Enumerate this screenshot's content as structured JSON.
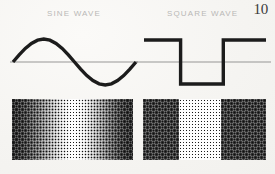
{
  "page": {
    "number": "10",
    "width": 275,
    "height": 174,
    "background_color": "#f7f6f3",
    "ink_color": "#1c1c1c",
    "caption_color": "#b9b8b6",
    "axis_color": "#6f6f6f"
  },
  "figures": [
    {
      "id": "sine",
      "caption": "SINE WAVE",
      "wave_type": "sine",
      "description": "One full cycle of a sine wave drawn with a heavy black stroke over a thin horizontal zero axis."
    },
    {
      "id": "square",
      "caption": "SQUARE WAVE",
      "wave_type": "square",
      "description": "One full cycle of a square wave drawn with a heavy black stroke over a thin horizontal zero axis."
    }
  ],
  "chart_data": [
    {
      "type": "line",
      "id": "sine-wave-plot",
      "title": "SINE WAVE",
      "xlabel": "",
      "ylabel": "",
      "xlim": [
        0,
        1
      ],
      "ylim": [
        -1,
        1
      ],
      "grid": false,
      "legend": "none",
      "axis": {
        "zero_line": 0,
        "zero_line_visible": true
      },
      "series": [
        {
          "name": "sine",
          "x": [
            0.0,
            0.05,
            0.1,
            0.15,
            0.2,
            0.25,
            0.3,
            0.35,
            0.4,
            0.45,
            0.5,
            0.55,
            0.6,
            0.65,
            0.7,
            0.75,
            0.8,
            0.85,
            0.9,
            0.95,
            1.0
          ],
          "y": [
            0.0,
            0.31,
            0.59,
            0.81,
            0.95,
            1.0,
            0.95,
            0.81,
            0.59,
            0.31,
            0.0,
            -0.31,
            -0.59,
            -0.81,
            -0.95,
            -1.0,
            -0.95,
            -0.81,
            -0.59,
            -0.31,
            0.0
          ]
        }
      ]
    },
    {
      "type": "line",
      "id": "square-wave-plot",
      "title": "SQUARE WAVE",
      "xlabel": "",
      "ylabel": "",
      "xlim": [
        0,
        1
      ],
      "ylim": [
        -1,
        1
      ],
      "grid": false,
      "legend": "none",
      "axis": {
        "zero_line": 0,
        "zero_line_visible": true
      },
      "series": [
        {
          "name": "square",
          "x": [
            0.0,
            0.3,
            0.3,
            0.65,
            0.65,
            1.0
          ],
          "y": [
            1.0,
            1.0,
            -1.0,
            -1.0,
            1.0,
            1.0
          ]
        }
      ]
    },
    {
      "type": "heatmap",
      "id": "sine-halftone-strip",
      "title": "",
      "description": "Halftone dot-screen strip whose dot density follows the sine wave brightness profile: dark at the left edge, lightening to near-white at centre, darkening again toward the right.",
      "pattern": "halftone-dot-screen",
      "dot_pitch_px": 3,
      "xlabel": "",
      "ylabel": "",
      "x": [
        0.0,
        0.1,
        0.2,
        0.3,
        0.4,
        0.5,
        0.6,
        0.7,
        0.8,
        0.9,
        1.0
      ],
      "values": [
        0.95,
        0.86,
        0.7,
        0.5,
        0.28,
        0.1,
        0.22,
        0.45,
        0.68,
        0.86,
        0.95
      ]
    },
    {
      "type": "heatmap",
      "id": "square-halftone-strip",
      "title": "",
      "description": "Halftone dot-screen strip with three hard-edged bands matching the square wave: dark band, light band, dark band.",
      "pattern": "halftone-dot-screen",
      "dot_pitch_px": 3,
      "xlabel": "",
      "ylabel": "",
      "bands": [
        {
          "from": 0.0,
          "to": 0.3,
          "density": 0.88
        },
        {
          "from": 0.3,
          "to": 0.64,
          "density": 0.12
        },
        {
          "from": 0.64,
          "to": 1.0,
          "density": 0.88
        }
      ],
      "x": [
        0.0,
        0.15,
        0.29,
        0.31,
        0.5,
        0.63,
        0.65,
        0.82,
        1.0
      ],
      "values": [
        0.88,
        0.88,
        0.88,
        0.12,
        0.12,
        0.12,
        0.88,
        0.88,
        0.88
      ]
    }
  ]
}
